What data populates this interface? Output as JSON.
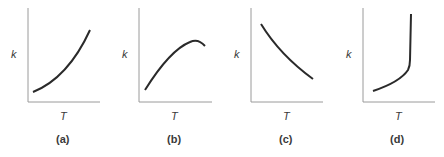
{
  "panels": [
    {
      "id": "a",
      "label": "(a)",
      "ylabel": "k",
      "xlabel": "T",
      "shape": "increasing-convex"
    },
    {
      "id": "b",
      "label": "(b)",
      "ylabel": "k",
      "xlabel": "T",
      "shape": "rise-then-fall"
    },
    {
      "id": "c",
      "label": "(c)",
      "ylabel": "k",
      "xlabel": "T",
      "shape": "decreasing"
    },
    {
      "id": "d",
      "label": "(d)",
      "ylabel": "k",
      "xlabel": "T",
      "shape": "slow-rise-then-vertical"
    }
  ],
  "colors": {
    "axis": "#9a9a9a",
    "curve": "#2a2a2a",
    "text": "#3a3a3a"
  }
}
